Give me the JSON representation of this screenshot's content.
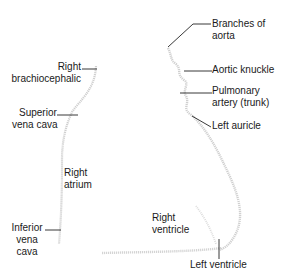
{
  "diagram": {
    "type": "heart-silhouette-outline",
    "labels": {
      "right_brachiocephalic": [
        "Right",
        "brachiocephalic"
      ],
      "superior_vena_cava": [
        "Superior",
        "vena cava"
      ],
      "right_atrium": [
        "Right",
        "atrium"
      ],
      "inferior_vena_cava": [
        "Inferior",
        "vena",
        "cava"
      ],
      "branches_of_aorta": [
        "Branches of",
        "aorta"
      ],
      "aortic_knuckle": [
        "Aortic knuckle"
      ],
      "pulmonary_artery": [
        "Pulmonary",
        "artery (trunk)"
      ],
      "left_auricle": [
        "Left auricle"
      ],
      "right_ventricle": [
        "Right",
        "ventricle"
      ],
      "left_ventricle": [
        "Left ventricle"
      ]
    },
    "colors": {
      "outline": "#c8c8c8",
      "leader": "#222222",
      "text": "#1a1a1a"
    }
  }
}
